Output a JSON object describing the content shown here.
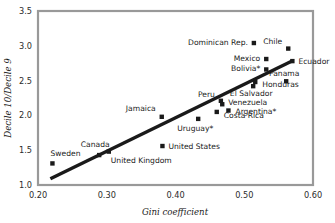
{
  "chart_data": {
    "type": "scatter",
    "title": "",
    "xlabel": "Gini coefficient",
    "ylabel": "Decile 10/Decile 9",
    "xlim": [
      0.2,
      0.6
    ],
    "ylim": [
      1.0,
      3.5
    ],
    "xticks": [
      "0.20",
      "0.30",
      "0.40",
      "0.50",
      "0.60"
    ],
    "xtick_values": [
      0.2,
      0.3,
      0.4,
      0.5,
      0.6
    ],
    "yticks": [
      "1.0",
      "1.5",
      "2.0",
      "2.5",
      "3.0",
      "3.5"
    ],
    "ytick_values": [
      1.0,
      1.5,
      2.0,
      2.5,
      3.0,
      3.5
    ],
    "grid": "horizontal-and-vertical",
    "legend": "none",
    "marker_shape": "square",
    "marker_color": "#1a1a1a",
    "trendline": {
      "name": "linear fit",
      "x_start": 0.218,
      "y_start": 1.09,
      "x_end": 0.571,
      "y_end": 2.79,
      "color": "#1a1a1a"
    },
    "points": [
      {
        "label": "Sweden",
        "x": 0.221,
        "y": 1.31,
        "label_dx": -2,
        "label_dy": -7,
        "anchor": "start"
      },
      {
        "label": "Canada",
        "x": 0.289,
        "y": 1.43,
        "label_dx": -4,
        "label_dy": -8,
        "anchor": "middle"
      },
      {
        "label": "United Kingdom",
        "x": 0.303,
        "y": 1.48,
        "label_dx": 2,
        "label_dy": 11,
        "anchor": "start"
      },
      {
        "label": "United States",
        "x": 0.381,
        "y": 1.56,
        "label_dx": 6,
        "label_dy": 3,
        "anchor": "start"
      },
      {
        "label": "Jamaica",
        "x": 0.38,
        "y": 1.98,
        "label_dx": -6,
        "label_dy": -6,
        "anchor": "end"
      },
      {
        "label": "Uruguay*",
        "x": 0.433,
        "y": 1.95,
        "label_dx": -3,
        "label_dy": 12,
        "anchor": "middle"
      },
      {
        "label": "Costa Rica",
        "x": 0.46,
        "y": 2.05,
        "label_dx": 7,
        "label_dy": 6,
        "anchor": "start"
      },
      {
        "label": "Argentina*",
        "x": 0.477,
        "y": 2.07,
        "label_dx": 7,
        "label_dy": 3,
        "anchor": "start"
      },
      {
        "label": "Venezuela",
        "x": 0.468,
        "y": 2.16,
        "label_dx": 6,
        "label_dy": 1,
        "anchor": "start"
      },
      {
        "label": "Peru",
        "x": 0.466,
        "y": 2.21,
        "label_dx": -6,
        "label_dy": -4,
        "anchor": "end"
      },
      {
        "label": "El Salvador",
        "x": 0.513,
        "y": 2.42,
        "label_dx": -2,
        "label_dy": 10,
        "anchor": "middle"
      },
      {
        "label": "Honduras",
        "x": 0.516,
        "y": 2.48,
        "label_dx": 7,
        "label_dy": 5,
        "anchor": "start"
      },
      {
        "label": "Panama",
        "x": 0.561,
        "y": 2.49,
        "label_dx": -2,
        "label_dy": -5,
        "anchor": "middle"
      },
      {
        "label": "Bolivia*",
        "x": 0.532,
        "y": 2.66,
        "label_dx": -6,
        "label_dy": 2,
        "anchor": "end"
      },
      {
        "label": "Ecuador",
        "x": 0.57,
        "y": 2.78,
        "label_dx": 6,
        "label_dy": 3,
        "anchor": "start"
      },
      {
        "label": "Mexico",
        "x": 0.532,
        "y": 2.81,
        "label_dx": -6,
        "label_dy": 2,
        "anchor": "end"
      },
      {
        "label": "Chile",
        "x": 0.564,
        "y": 2.96,
        "label_dx": -6,
        "label_dy": -5,
        "anchor": "end"
      },
      {
        "label": "Dominican Rep.",
        "x": 0.514,
        "y": 3.04,
        "label_dx": -6,
        "label_dy": 2,
        "anchor": "end"
      }
    ]
  }
}
